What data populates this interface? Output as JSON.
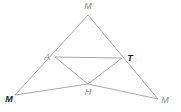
{
  "diagram": {
    "line_color": "#a8a8a8",
    "points": [
      {
        "id": "top",
        "label": "M",
        "x": 88,
        "y": 15,
        "lx": 88,
        "ly": 9,
        "bold": false
      },
      {
        "id": "A",
        "label": "A",
        "x": 55,
        "y": 57,
        "lx": 47,
        "ly": 60,
        "bold": false
      },
      {
        "id": "T",
        "label": "T",
        "x": 122,
        "y": 58,
        "lx": 130,
        "ly": 61,
        "bold": true
      },
      {
        "id": "left",
        "label": "M",
        "x": 15,
        "y": 95,
        "lx": 9,
        "ly": 102,
        "bold": true
      },
      {
        "id": "H",
        "label": "H",
        "x": 88,
        "y": 84,
        "lx": 88,
        "ly": 95,
        "bold": false
      },
      {
        "id": "right",
        "label": "M",
        "x": 158,
        "y": 99,
        "lx": 165,
        "ly": 103,
        "bold": false
      }
    ],
    "segments": [
      [
        "top",
        "left"
      ],
      [
        "top",
        "right"
      ],
      [
        "A",
        "T"
      ],
      [
        "A",
        "H"
      ],
      [
        "H",
        "T"
      ],
      [
        "left",
        "H"
      ],
      [
        "H",
        "right"
      ]
    ]
  }
}
